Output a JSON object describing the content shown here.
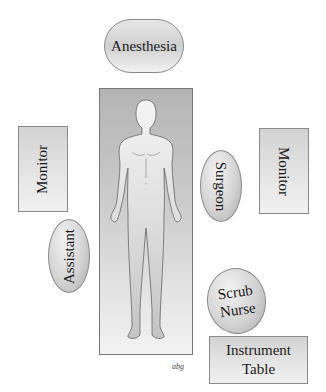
{
  "diagram": {
    "positions": {
      "anesthesia": "Anesthesia",
      "monitor_left": "Monitor",
      "monitor_right": "Monitor",
      "surgeon": "Surgeon",
      "assistant": "Assistant",
      "scrub_nurse_line1": "Scrub",
      "scrub_nurse_line2": "Nurse",
      "instrument_table_line1": "Instrument",
      "instrument_table_line2": "Table"
    },
    "signature": "abg"
  }
}
